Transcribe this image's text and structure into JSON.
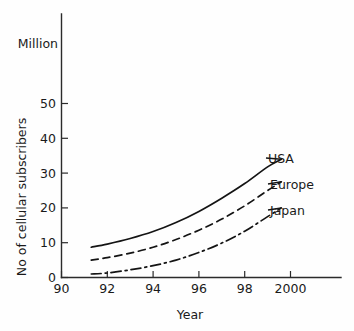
{
  "chart_data": {
    "type": "line",
    "title": "",
    "unit_label": "Million",
    "xlabel": "Year",
    "ylabel": "No of cellular subscribers",
    "xlim": [
      90,
      102
    ],
    "ylim": [
      0,
      58
    ],
    "grid": false,
    "legend_position": "inline-right-end-labels",
    "xticks": [
      "90",
      "92",
      "94",
      "96",
      "98",
      "2000"
    ],
    "xtick_values": [
      90,
      92,
      94,
      96,
      98,
      100
    ],
    "yticks": [
      "0",
      "10",
      "20",
      "30",
      "40",
      "50"
    ],
    "ytick_values": [
      0,
      10,
      20,
      30,
      40,
      50
    ],
    "x": [
      91.3,
      92,
      93,
      94,
      95,
      96,
      97,
      98,
      99,
      99.6
    ],
    "series": [
      {
        "name": "USA",
        "style": "solid",
        "values": [
          8.7,
          9.6,
          11.2,
          13.2,
          15.8,
          19.0,
          22.8,
          27.0,
          31.8,
          34.0
        ]
      },
      {
        "name": "Europe",
        "style": "dashed",
        "values": [
          5.0,
          5.7,
          7.0,
          8.7,
          10.9,
          13.6,
          16.8,
          20.6,
          25.0,
          27.5
        ]
      },
      {
        "name": "Japan",
        "style": "dash-dot",
        "values": [
          1.0,
          1.3,
          2.2,
          3.4,
          5.0,
          7.2,
          9.9,
          13.3,
          17.5,
          20.0
        ]
      }
    ],
    "colors": {
      "axis": "#2b2b2b",
      "line": "#141414",
      "background": "#fefefe",
      "text": "#1a1a1a"
    }
  }
}
